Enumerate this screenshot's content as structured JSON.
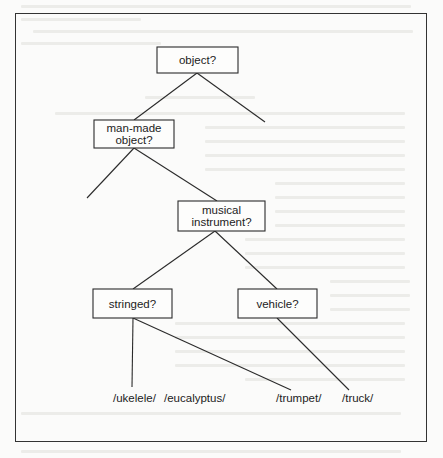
{
  "figure": {
    "frame": {
      "x": 15,
      "y": 13,
      "width": 412,
      "height": 429
    },
    "colors": {
      "ink": "#2b2b2b",
      "paper": "#fbfbfa",
      "bleed": "#ecece9"
    }
  },
  "nodes": [
    {
      "id": "object",
      "lines": [
        "object?"
      ],
      "x": 157,
      "y": 47,
      "w": 81,
      "h": 26
    },
    {
      "id": "man_made",
      "lines": [
        "man-made",
        "object?"
      ],
      "x": 94,
      "y": 120,
      "w": 80,
      "h": 28
    },
    {
      "id": "musical",
      "lines": [
        "musical",
        "instrument?"
      ],
      "x": 178,
      "y": 201,
      "w": 87,
      "h": 30
    },
    {
      "id": "stringed",
      "lines": [
        "stringed?"
      ],
      "x": 93,
      "y": 289,
      "w": 79,
      "h": 29
    },
    {
      "id": "vehicle",
      "lines": [
        "vehicle?"
      ],
      "x": 238,
      "y": 289,
      "w": 79,
      "h": 29
    }
  ],
  "edges": [
    {
      "from": [
        197,
        73
      ],
      "to": [
        134,
        120
      ]
    },
    {
      "from": [
        197,
        73
      ],
      "to": [
        265,
        122
      ]
    },
    {
      "from": [
        134,
        148
      ],
      "to": [
        87,
        198
      ]
    },
    {
      "from": [
        134,
        148
      ],
      "to": [
        217,
        201
      ]
    },
    {
      "from": [
        215,
        231
      ],
      "to": [
        133,
        289
      ]
    },
    {
      "from": [
        215,
        231
      ],
      "to": [
        277,
        289
      ]
    },
    {
      "from": [
        133,
        318
      ],
      "to": [
        132,
        387
      ]
    },
    {
      "from": [
        133,
        318
      ],
      "to": [
        291,
        390
      ]
    },
    {
      "from": [
        277,
        318
      ],
      "to": [
        349,
        390
      ]
    }
  ],
  "leaves": [
    {
      "label": "/ukelele/",
      "x": 113,
      "y": 402
    },
    {
      "label": "/eucalyptus/",
      "x": 164,
      "y": 402
    },
    {
      "label": "/trumpet/",
      "x": 276,
      "y": 402
    },
    {
      "label": "/truck/",
      "x": 342,
      "y": 402
    }
  ]
}
